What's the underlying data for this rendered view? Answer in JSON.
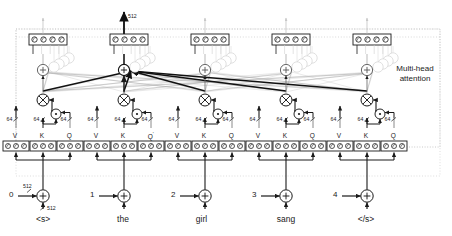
{
  "figure": {
    "type": "diagram",
    "width": 452,
    "height": 236,
    "background": "#ffffff",
    "ink": "#1a1a1a",
    "faint": "#b9b9b9",
    "ghost": "#cfcfcf"
  },
  "annotation": {
    "multi_head_line1": "Multi-head",
    "multi_head_line2": "attention"
  },
  "dims": {
    "model_dim": "512",
    "head_dim": "64",
    "output_dim": "512",
    "embed_dim": "512",
    "pos_dim": "512"
  },
  "columns": [
    {
      "index": 0,
      "position": "0",
      "token": "<s>",
      "x": 43,
      "vkq": {
        "v": "V",
        "k": "K",
        "q": "Q",
        "q_superscript": ""
      },
      "head_dim_labels": [
        "64",
        "64",
        "64"
      ],
      "top_cells": 3,
      "show_pos_dim": true,
      "show_embed_dim": true,
      "show_output_dim": false
    },
    {
      "index": 1,
      "position": "1",
      "token": "the",
      "x": 124,
      "vkq": {
        "v": "V",
        "k": "K",
        "q": "Q",
        "q_superscript": "'"
      },
      "head_dim_labels": [
        "64",
        "64",
        "64"
      ],
      "top_cells": 3,
      "show_pos_dim": false,
      "show_embed_dim": false,
      "show_output_dim": true
    },
    {
      "index": 2,
      "position": "2",
      "token": "girl",
      "x": 205,
      "vkq": {
        "v": "V",
        "k": "K",
        "q": "Q",
        "q_superscript": ""
      },
      "head_dim_labels": [
        "64",
        "64",
        "64"
      ],
      "top_cells": 3,
      "show_pos_dim": false,
      "show_embed_dim": false,
      "show_output_dim": false
    },
    {
      "index": 3,
      "position": "3",
      "token": "sang",
      "x": 286,
      "vkq": {
        "v": "V",
        "k": "K",
        "q": "Q",
        "q_superscript": ""
      },
      "head_dim_labels": [
        "64",
        "64",
        "64"
      ],
      "top_cells": 3,
      "show_pos_dim": false,
      "show_embed_dim": false,
      "show_output_dim": false
    },
    {
      "index": 4,
      "position": "4",
      "token": "</s>",
      "x": 367,
      "vkq": {
        "v": "V",
        "k": "K",
        "q": "Q",
        "q_superscript": ""
      },
      "head_dim_labels": [
        "64",
        "64",
        "64"
      ],
      "top_cells": 3,
      "show_pos_dim": false,
      "show_embed_dim": false,
      "show_output_dim": false
    }
  ],
  "operators": {
    "sum": "+",
    "product": "×",
    "dot": "·"
  }
}
